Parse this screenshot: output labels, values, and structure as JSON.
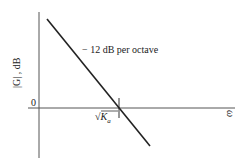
{
  "diagram": {
    "type": "bode-magnitude-asymptote",
    "y_axis_label": "|G| , dB",
    "x_axis_label": "ω",
    "origin_label": "0",
    "slope_annotation": "− 12 dB per octave",
    "crossover_label": {
      "sqrt": "√",
      "symbol": "K",
      "subscript": "a"
    },
    "line_color": "#222222"
  }
}
